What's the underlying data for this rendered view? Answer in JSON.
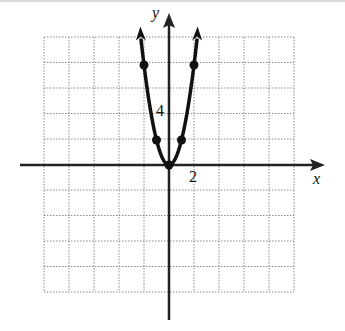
{
  "chart_data": {
    "type": "line",
    "title": "",
    "function": "y = 2x^2",
    "xlabel": "x",
    "ylabel": "y",
    "tick_labels": {
      "x": [
        "2"
      ],
      "y": [
        "4"
      ]
    },
    "grid": true,
    "grid_spacing": 2,
    "xlim": [
      -10,
      10
    ],
    "ylim": [
      -10,
      10
    ],
    "points": [
      {
        "x": -2,
        "y": 8
      },
      {
        "x": -1,
        "y": 2
      },
      {
        "x": 0,
        "y": 0
      },
      {
        "x": 1,
        "y": 2
      },
      {
        "x": 2,
        "y": 8
      }
    ],
    "arrows": "both ends upward",
    "colors": {
      "curve": "#111111",
      "grid": "#888888",
      "axes": "#222222"
    }
  },
  "labels": {
    "x_axis": "x",
    "y_axis": "y",
    "x_tick": "2",
    "y_tick": "4"
  }
}
